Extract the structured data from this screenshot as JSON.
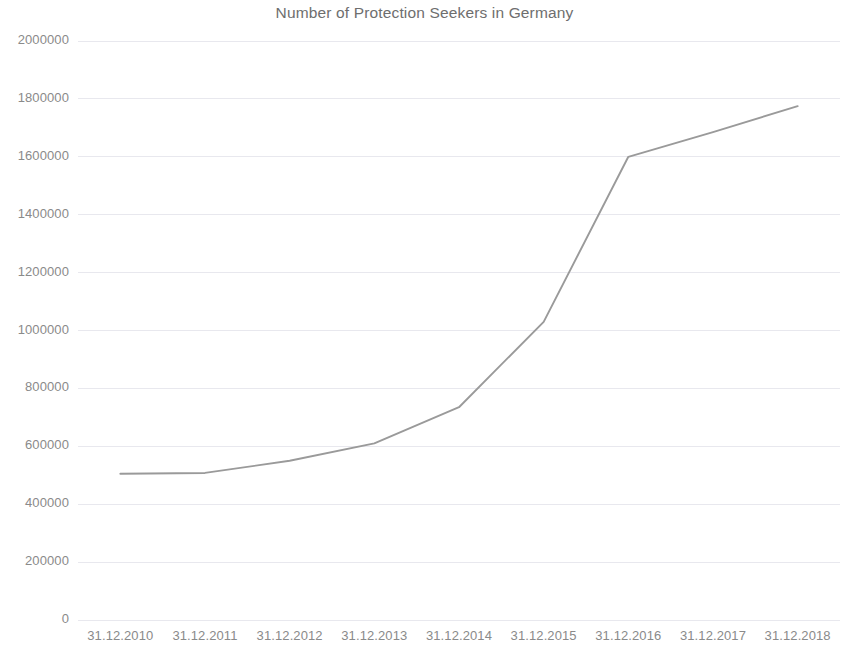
{
  "chart_data": {
    "type": "line",
    "title": "Number of Protection Seekers in Germany",
    "xlabel": "",
    "ylabel": "",
    "categories": [
      "31.12.2010",
      "31.12.2011",
      "31.12.2012",
      "31.12.2013",
      "31.12.2014",
      "31.12.2015",
      "31.12.2016",
      "31.12.2017",
      "31.12.2018"
    ],
    "values": [
      505000,
      508000,
      550000,
      610000,
      735000,
      1030000,
      1600000,
      1685000,
      1775000
    ],
    "series": [
      {
        "name": "Protection Seekers",
        "values": [
          505000,
          508000,
          550000,
          610000,
          735000,
          1030000,
          1600000,
          1685000,
          1775000
        ]
      }
    ],
    "ylim": [
      0,
      2000000
    ],
    "y_ticks": [
      0,
      200000,
      400000,
      600000,
      800000,
      1000000,
      1200000,
      1400000,
      1600000,
      1800000,
      2000000
    ],
    "y_tick_labels": [
      "0",
      "200000",
      "400000",
      "600000",
      "800000",
      "1000000",
      "1200000",
      "1400000",
      "1600000",
      "1800000",
      "2000000"
    ],
    "grid": true,
    "grid_axis": "y",
    "legend": false,
    "legend_position": "none",
    "line_color": "#9a9a9a",
    "grid_color": "#e8e8ee",
    "text_color": "#8a8a8a",
    "title_color": "#6e6e6e",
    "background_color": "#ffffff",
    "markers": false
  }
}
